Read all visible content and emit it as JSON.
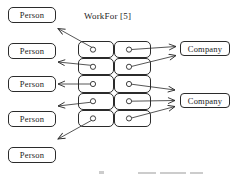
{
  "diagram": {
    "relation_label": "WorkFor [5]",
    "persons": [
      {
        "label": "Person"
      },
      {
        "label": "Person"
      },
      {
        "label": "Person"
      },
      {
        "label": "Person"
      },
      {
        "label": "Person"
      }
    ],
    "companies": [
      {
        "label": "Company"
      },
      {
        "label": "Company"
      }
    ],
    "link_table": {
      "rows": 5,
      "columns": 2,
      "cell_symbol": "circle-port",
      "links": [
        {
          "row": 1,
          "person_index": 1,
          "company_index": 1
        },
        {
          "row": 2,
          "person_index": 2,
          "company_index": 1
        },
        {
          "row": 3,
          "person_index": 3,
          "company_index": 2
        },
        {
          "row": 4,
          "person_index": 4,
          "company_index": 2
        },
        {
          "row": 5,
          "person_index": 5,
          "company_index": 2
        }
      ]
    },
    "colors": {
      "stroke": "#2b2b2b",
      "box_fill": "#ffffff",
      "background": "#ffffff"
    }
  }
}
